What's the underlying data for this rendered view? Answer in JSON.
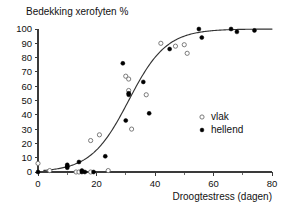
{
  "chart_data": {
    "type": "scatter",
    "title": "",
    "ylabel": "Bedekking xerofyten %",
    "xlabel": "Droogtestress (dagen)",
    "xlim": [
      0,
      80
    ],
    "ylim": [
      0,
      100
    ],
    "grid": false,
    "x_ticks": [
      0,
      20,
      40,
      60,
      80
    ],
    "x_tick_labels": [
      "0",
      "20",
      "40",
      "60",
      "80"
    ],
    "x_minor_ticks": [
      10,
      30,
      50,
      70
    ],
    "y_ticks": [
      0,
      10,
      20,
      30,
      40,
      50,
      60,
      70,
      80,
      90,
      100
    ],
    "y_tick_labels": [
      "0",
      "10",
      "20",
      "30",
      "40",
      "50",
      "60",
      "70",
      "80",
      "90",
      "100"
    ],
    "legend_position": "center-right",
    "series": [
      {
        "name": "vlak",
        "marker": "open-circle",
        "color": "#6d6d6d",
        "points": [
          [
            0,
            6
          ],
          [
            4,
            1
          ],
          [
            13,
            0
          ],
          [
            14,
            0
          ],
          [
            18,
            22
          ],
          [
            18,
            0
          ],
          [
            21,
            26
          ],
          [
            24,
            1
          ],
          [
            30,
            67
          ],
          [
            31,
            65
          ],
          [
            31,
            57
          ],
          [
            32,
            30
          ],
          [
            37,
            54
          ],
          [
            42,
            90
          ],
          [
            47,
            88
          ],
          [
            50,
            89
          ],
          [
            51,
            83
          ]
        ]
      },
      {
        "name": "hellend",
        "marker": "filled-circle",
        "color": "#000000",
        "points": [
          [
            0,
            0
          ],
          [
            10,
            4
          ],
          [
            10,
            5
          ],
          [
            10,
            3
          ],
          [
            14,
            7
          ],
          [
            15,
            0
          ],
          [
            15,
            1
          ],
          [
            16,
            0
          ],
          [
            19,
            0
          ],
          [
            23,
            11
          ],
          [
            29,
            76
          ],
          [
            30,
            36
          ],
          [
            31,
            55
          ],
          [
            31,
            54
          ],
          [
            36,
            63
          ],
          [
            38,
            41
          ],
          [
            45,
            86
          ],
          [
            55,
            100
          ],
          [
            56,
            94
          ],
          [
            66,
            100
          ],
          [
            68,
            98
          ],
          [
            74,
            99
          ]
        ]
      }
    ],
    "fit_curve": {
      "name": "logistic-fit",
      "model": "logistic",
      "midpoint": 31,
      "slope": 0.155,
      "max": 100,
      "x_start": 2,
      "x_end": 80
    },
    "legend": [
      {
        "label": "vlak",
        "marker": "open-circle"
      },
      {
        "label": "hellend",
        "marker": "filled-circle"
      }
    ]
  }
}
